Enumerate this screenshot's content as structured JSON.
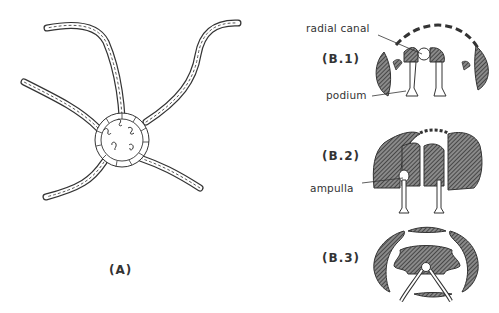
{
  "figure": {
    "panels": [
      {
        "id": "A",
        "label": "(A)",
        "description": "Brittle star, oral view, with five segmented arms"
      },
      {
        "id": "B1",
        "label": "(B.1)",
        "description": "Arm cross-section with podia extended"
      },
      {
        "id": "B2",
        "label": "(B.2)",
        "description": "Arm cross-section showing ampulla"
      },
      {
        "id": "B3",
        "label": "(B.3)",
        "description": "Arm cross-section with podia bent"
      }
    ],
    "annotations": {
      "radial_canal": "radial canal",
      "podium": "podium",
      "ampulla": "ampulla"
    },
    "colors": {
      "ink": "#2a2a2a",
      "hatch": "#3a3a3a",
      "background": "#ffffff"
    }
  }
}
